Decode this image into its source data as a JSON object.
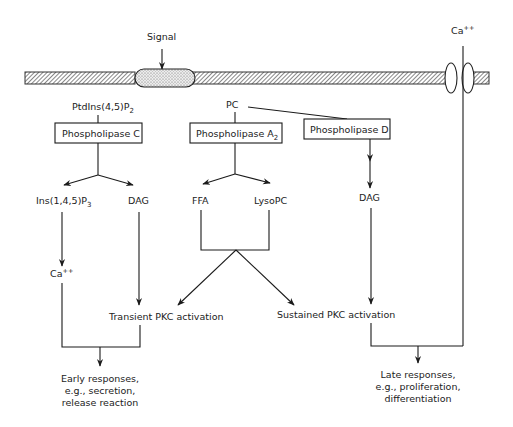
{
  "diagram": {
    "type": "signal-transduction-pathway",
    "membrane": {
      "signal_label": "Signal",
      "channel_ion_label": "Ca",
      "channel_ion_charge": "++"
    },
    "substrates": {
      "pip2": {
        "base": "PtdIns(4,5)P",
        "subscript": "2"
      },
      "pc": "PC"
    },
    "enzymes": {
      "plc": "Phospholipase C",
      "pla2": {
        "base": "Phospholipase A",
        "subscript": "2"
      },
      "pld": "Phospholipase D"
    },
    "products": {
      "ip3": {
        "base": "Ins(1,4,5)P",
        "subscript": "3"
      },
      "dag_left": "DAG",
      "ffa": "FFA",
      "lysopc": "LysoPC",
      "dag_right": "DAG",
      "calcium": {
        "base": "Ca",
        "superscript": "++"
      }
    },
    "activation": {
      "transient": "Transient PKC activation",
      "sustained": "Sustained PKC activation"
    },
    "responses": {
      "early": [
        "Early responses,",
        "e.g., secretion,",
        "release reaction"
      ],
      "late": [
        "Late responses,",
        "e.g., proliferation,",
        "differentiation"
      ]
    },
    "edges": [
      {
        "from": "Signal",
        "to": "receptor"
      },
      {
        "from": "PtdIns(4,5)P2",
        "to": "Phospholipase C"
      },
      {
        "from": "Phospholipase C",
        "to": "Ins(1,4,5)P3"
      },
      {
        "from": "Phospholipase C",
        "to": "DAG"
      },
      {
        "from": "Ins(1,4,5)P3",
        "to": "Ca++"
      },
      {
        "from": "DAG",
        "to": "Transient PKC activation"
      },
      {
        "from": "PC",
        "to": "Phospholipase A2"
      },
      {
        "from": "PC",
        "to": "Phospholipase D"
      },
      {
        "from": "Phospholipase A2",
        "to": "FFA"
      },
      {
        "from": "Phospholipase A2",
        "to": "LysoPC"
      },
      {
        "from": "FFA + LysoPC",
        "to": "Transient PKC activation"
      },
      {
        "from": "FFA + LysoPC",
        "to": "Sustained PKC activation"
      },
      {
        "from": "Phospholipase D",
        "to": "DAG (right)"
      },
      {
        "from": "DAG (right)",
        "to": "Sustained PKC activation"
      },
      {
        "from": "Ca++ + Transient PKC activation",
        "to": "Early responses"
      },
      {
        "from": "Ca++ channel + Sustained PKC activation",
        "to": "Late responses"
      }
    ]
  }
}
